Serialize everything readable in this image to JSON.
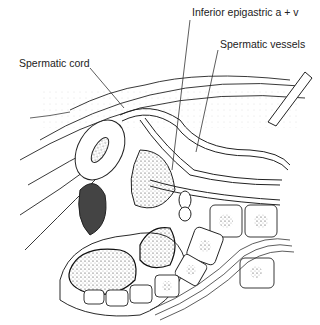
{
  "figure": {
    "type": "anatomical illustration",
    "style": "black-and-white pen and stipple drawing",
    "colors": {
      "background": "#ffffff",
      "ink": "#1a1a1a",
      "label_text": "#222222"
    }
  },
  "labels": [
    {
      "id": "inferior-epigastric",
      "text": "Inferior epigastric a + v",
      "x": 192,
      "y": 12
    },
    {
      "id": "spermatic-vessels",
      "text": "Spermatic vessels",
      "x": 220,
      "y": 44
    },
    {
      "id": "spermatic-cord",
      "text": "Spermatic cord",
      "x": 19,
      "y": 63
    }
  ]
}
